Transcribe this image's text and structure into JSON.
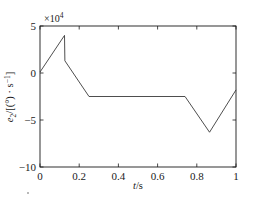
{
  "chart_data": {
    "type": "line",
    "title": "",
    "xlabel": "t/s",
    "ylabel": "e₂/[(°) · s⁻¹]",
    "y_exponent_label": "×10⁴",
    "y_scale": 10000,
    "xlim": [
      0,
      1
    ],
    "ylim": [
      -10,
      5
    ],
    "xticks": [
      0,
      0.2,
      0.4,
      0.6,
      0.8,
      1
    ],
    "xticklabels": [
      "0",
      "0.2",
      "0.4",
      "0.6",
      "0.8",
      "1"
    ],
    "yticks": [
      5,
      0,
      -5,
      -10
    ],
    "yticklabels": [
      "5",
      "0",
      "−5",
      "−10"
    ],
    "grid": false,
    "legend": null,
    "box": true,
    "tick_direction": "in",
    "series": [
      {
        "name": "e2",
        "color": "#3a3a3a",
        "x": [
          0,
          0.125,
          0.127,
          0.25,
          0.74,
          0.865,
          1.0
        ],
        "y": [
          0.1,
          4.0,
          1.3,
          -2.5,
          -2.5,
          -6.3,
          -1.8
        ]
      }
    ]
  },
  "axis_label_parts": {
    "y_var": "e",
    "y_sub": "2",
    "y_rest": "/[(°) · s",
    "y_sup": "−1",
    "y_close": "]",
    "x_var": "t",
    "x_rest": "/s"
  },
  "exponent_parts": {
    "times_ten": "×10",
    "power": "4"
  },
  "colors": {
    "axis": "#1a1a1a",
    "line": "#3a3a3a",
    "background": "#ffffff"
  }
}
